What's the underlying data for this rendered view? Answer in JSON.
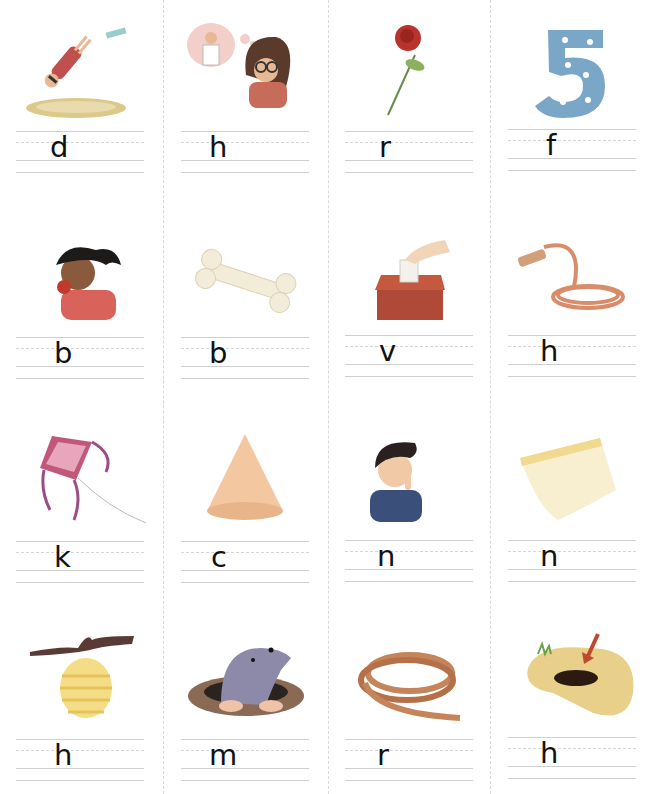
{
  "worksheet": {
    "rows": [
      {
        "cells": [
          {
            "picture": "diver-diving-into-pool",
            "letter": "d"
          },
          {
            "picture": "girl-dreaming-of-scientist",
            "letter": "h"
          },
          {
            "picture": "rose",
            "letter": "r"
          },
          {
            "picture": "number-five",
            "letter": "f"
          }
        ]
      },
      {
        "cells": [
          {
            "picture": "girl-biting-apple",
            "letter": "b"
          },
          {
            "picture": "bone",
            "letter": "b"
          },
          {
            "picture": "ballot-box-vote",
            "letter": "v"
          },
          {
            "picture": "garden-hose",
            "letter": "h"
          }
        ]
      },
      {
        "cells": [
          {
            "picture": "kite",
            "letter": "k"
          },
          {
            "picture": "cone",
            "letter": "c"
          },
          {
            "picture": "boy-pointing-to-nose",
            "letter": "n"
          },
          {
            "picture": "note-paper",
            "letter": "n"
          }
        ]
      },
      {
        "cells": [
          {
            "picture": "beehive-hive",
            "letter": "h"
          },
          {
            "picture": "mole-in-hole",
            "letter": "m"
          },
          {
            "picture": "rope",
            "letter": "r"
          },
          {
            "picture": "hole-in-ground",
            "letter": "h"
          }
        ]
      }
    ]
  },
  "colors": {
    "line_solid": "#cfcfcf",
    "line_dashed": "#d6d6d6",
    "separator": "#d9d9d9",
    "letter": "#111111"
  }
}
